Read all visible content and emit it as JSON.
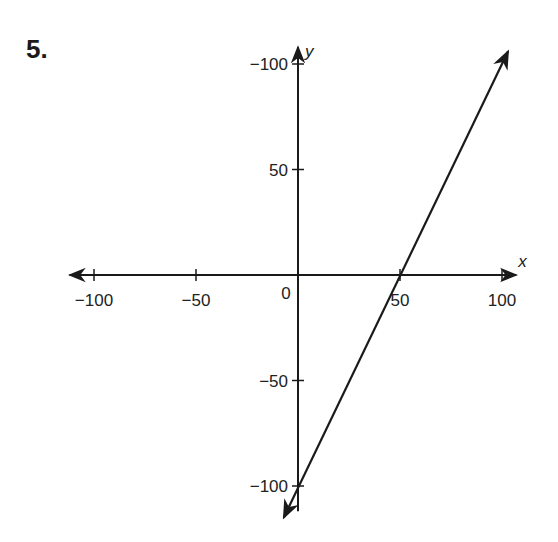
{
  "problem": {
    "number": "5."
  },
  "chart_data": {
    "type": "line",
    "title": "",
    "xlabel": "x",
    "ylabel": "y",
    "xlim": [
      -100,
      100
    ],
    "ylim": [
      -100,
      100
    ],
    "grid": false,
    "x_ticks": [
      {
        "value": -100,
        "label": "−100"
      },
      {
        "value": -50,
        "label": "−50"
      },
      {
        "value": 50,
        "label": "50"
      },
      {
        "value": 100,
        "label": "100"
      }
    ],
    "y_ticks": [
      {
        "value": 100,
        "label": "−100"
      },
      {
        "value": 50,
        "label": "50"
      },
      {
        "value": -50,
        "label": "−50"
      },
      {
        "value": -100,
        "label": "−100"
      }
    ],
    "origin_label": "0",
    "series": [
      {
        "name": "line",
        "equation": "y = 2x - 100",
        "points": [
          [
            50,
            0
          ],
          [
            0,
            -100
          ]
        ],
        "arrow_ends": [
          [
            103,
            106
          ],
          [
            -7,
            -115
          ]
        ]
      }
    ],
    "colors": {
      "ink": "#1a1a1a"
    }
  }
}
